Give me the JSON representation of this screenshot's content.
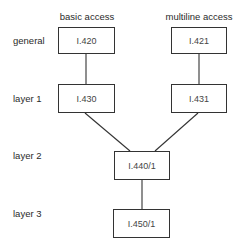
{
  "diagram": {
    "columns": [
      {
        "id": "basic",
        "label": "basic access"
      },
      {
        "id": "multiline",
        "label": "multiline access"
      }
    ],
    "rows": [
      {
        "id": "general",
        "label": "general"
      },
      {
        "id": "layer1",
        "label": "layer 1"
      },
      {
        "id": "layer2",
        "label": "layer 2"
      },
      {
        "id": "layer3",
        "label": "layer 3"
      }
    ],
    "nodes": [
      {
        "id": "n420",
        "label": "I.420",
        "row": "general",
        "column": "basic access"
      },
      {
        "id": "n421",
        "label": "I.421",
        "row": "general",
        "column": "multiline access"
      },
      {
        "id": "n430",
        "label": "I.430",
        "row": "layer 1",
        "column": "basic access"
      },
      {
        "id": "n431",
        "label": "I.431",
        "row": "layer 1",
        "column": "multiline access"
      },
      {
        "id": "n440",
        "label": "I.440/1",
        "row": "layer 2"
      },
      {
        "id": "n450",
        "label": "I.450/1",
        "row": "layer 3"
      }
    ],
    "edges": [
      {
        "from": "I.420",
        "to": "I.430"
      },
      {
        "from": "I.421",
        "to": "I.431"
      },
      {
        "from": "I.430",
        "to": "I.440/1"
      },
      {
        "from": "I.431",
        "to": "I.440/1"
      },
      {
        "from": "I.440/1",
        "to": "I.450/1"
      }
    ]
  }
}
